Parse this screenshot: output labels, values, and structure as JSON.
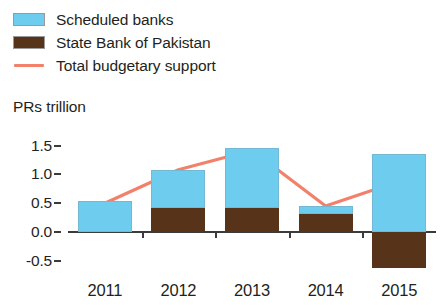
{
  "legend": {
    "items": [
      {
        "label": "Scheduled banks",
        "marker": "square-swatch-blue",
        "color": "#6ecdee"
      },
      {
        "label": "State Bank of Pakistan",
        "marker": "square-swatch-brown",
        "color": "#57331a"
      },
      {
        "label": "Total budgetary support",
        "marker": "line-swatch-salmon",
        "color": "#f2806a"
      }
    ]
  },
  "chart_data": {
    "type": "bar",
    "title": "",
    "subtitle": "",
    "xlabel": "",
    "ylabel": "PRs trillion",
    "categories": [
      "2011",
      "2012",
      "2013",
      "2014",
      "2015"
    ],
    "ylim": [
      -0.75,
      1.6
    ],
    "yticks": [
      1.5,
      1.0,
      0.5,
      0.0,
      -0.5
    ],
    "ytick_labels": [
      "1.5",
      "1.0",
      "0.5",
      "0.0",
      "-0.5"
    ],
    "grid": false,
    "stacked": true,
    "legend_position": "top-left",
    "series": [
      {
        "name": "Scheduled banks",
        "type": "bar",
        "color": "#6ecdee",
        "values": [
          0.53,
          0.66,
          1.04,
          0.13,
          1.35
        ]
      },
      {
        "name": "State Bank of Pakistan",
        "type": "bar",
        "color": "#57331a",
        "values": [
          0.0,
          0.42,
          0.41,
          0.32,
          -0.62
        ]
      },
      {
        "name": "Total budgetary support",
        "type": "line",
        "color": "#f2806a",
        "values": [
          0.5,
          1.08,
          1.42,
          0.45,
          0.88
        ]
      }
    ]
  }
}
